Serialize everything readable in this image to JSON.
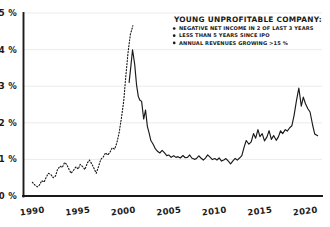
{
  "chart_data": {
    "type": "line",
    "title": "",
    "xlabel": "",
    "ylabel": "",
    "xlim": [
      1989.0,
      2021.8
    ],
    "ylim": [
      0,
      5
    ],
    "grid": true,
    "y_ticks": [
      0,
      1,
      2,
      3,
      4,
      5
    ],
    "y_tick_labels": [
      "0 %",
      "1 %",
      "2 %",
      "3 %",
      "4 %",
      "5 %"
    ],
    "x_ticks": [
      1990,
      1995,
      2000,
      2005,
      2010,
      2015,
      2020
    ],
    "x_tick_labels": [
      "1990",
      "1995",
      "2000",
      "2005",
      "2010",
      "2015",
      "2020"
    ],
    "legend_position": "top-right",
    "series": [
      {
        "name": "Young unprofitable company share (estimated, dashed)",
        "style": "dashed",
        "color": "#1a1a1a",
        "x": [
          1990.0,
          1990.25,
          1990.5,
          1990.75,
          1991.0,
          1991.25,
          1991.5,
          1991.75,
          1992.0,
          1992.25,
          1992.5,
          1992.75,
          1993.0,
          1993.25,
          1993.5,
          1993.75,
          1994.0,
          1994.25,
          1994.5,
          1994.75,
          1995.0,
          1995.25,
          1995.5,
          1995.75,
          1996.0,
          1996.25,
          1996.5,
          1996.75,
          1997.0,
          1997.25,
          1997.5,
          1997.75,
          1998.0,
          1998.25,
          1998.5,
          1998.75,
          1999.0,
          1999.25,
          1999.5,
          1999.75,
          2000.0,
          2000.25,
          2000.5,
          2000.75,
          2001.0
        ],
        "y": [
          0.38,
          0.3,
          0.25,
          0.3,
          0.42,
          0.38,
          0.52,
          0.62,
          0.58,
          0.5,
          0.55,
          0.72,
          0.82,
          0.78,
          0.92,
          0.86,
          0.72,
          0.62,
          0.7,
          0.8,
          0.74,
          0.86,
          0.8,
          0.72,
          0.9,
          0.98,
          0.88,
          0.75,
          0.62,
          0.8,
          1.0,
          1.06,
          1.18,
          1.12,
          1.2,
          1.32,
          1.28,
          1.45,
          1.72,
          2.1,
          2.6,
          3.25,
          3.9,
          4.4,
          4.65
        ]
      },
      {
        "name": "Young unprofitable company share (solid)",
        "style": "solid",
        "color": "#1a1a1a",
        "x": [
          2000.6,
          2000.8,
          2001.0,
          2001.2,
          2001.4,
          2001.6,
          2001.8,
          2002.0,
          2002.2,
          2002.4,
          2002.6,
          2002.8,
          2003.0,
          2003.25,
          2003.5,
          2003.75,
          2004.0,
          2004.25,
          2004.5,
          2004.75,
          2005.0,
          2005.25,
          2005.5,
          2005.75,
          2006.0,
          2006.25,
          2006.5,
          2006.75,
          2007.0,
          2007.25,
          2007.5,
          2007.75,
          2008.0,
          2008.25,
          2008.5,
          2008.75,
          2009.0,
          2009.25,
          2009.5,
          2009.75,
          2010.0,
          2010.25,
          2010.5,
          2010.75,
          2011.0,
          2011.25,
          2011.5,
          2011.75,
          2012.0,
          2012.25,
          2012.5,
          2012.75,
          2013.0,
          2013.25,
          2013.5,
          2013.75,
          2014.0,
          2014.25,
          2014.5,
          2014.75,
          2015.0,
          2015.25,
          2015.5,
          2015.75,
          2016.0,
          2016.25,
          2016.5,
          2016.75,
          2017.0,
          2017.25,
          2017.5,
          2017.75,
          2018.0,
          2018.25,
          2018.5,
          2018.75,
          2019.0,
          2019.25,
          2019.5,
          2019.75,
          2020.0,
          2020.25,
          2020.5,
          2020.75,
          2021.0,
          2021.3
        ],
        "y": [
          3.1,
          3.55,
          4.0,
          3.6,
          3.05,
          2.72,
          2.62,
          2.58,
          2.1,
          2.35,
          1.9,
          1.7,
          1.52,
          1.42,
          1.3,
          1.22,
          1.18,
          1.25,
          1.18,
          1.1,
          1.12,
          1.06,
          1.1,
          1.05,
          1.08,
          1.04,
          1.1,
          1.05,
          1.06,
          1.12,
          1.04,
          1.0,
          1.02,
          1.1,
          1.04,
          0.98,
          1.04,
          1.12,
          1.06,
          1.0,
          1.02,
          0.98,
          1.04,
          0.96,
          0.98,
          1.02,
          0.95,
          0.88,
          0.96,
          1.02,
          0.98,
          1.04,
          1.1,
          1.35,
          1.52,
          1.42,
          1.48,
          1.7,
          1.58,
          1.82,
          1.62,
          1.7,
          1.5,
          1.62,
          1.78,
          1.55,
          1.65,
          1.52,
          1.62,
          1.78,
          1.7,
          1.82,
          1.78,
          1.86,
          1.92,
          2.2,
          2.6,
          2.95,
          2.45,
          2.7,
          2.52,
          2.38,
          2.3,
          1.95,
          1.7,
          1.65
        ]
      }
    ],
    "legend": {
      "title": "YOUNG UNPROFITABLE COMPANY:",
      "items": [
        "NEGATIVE NET INCOME IN 2 OF LAST 3 YEARS",
        "LESS THAN 5 YEARS SINCE IPO",
        "ANNUAL REVENUES GROWING >15 %"
      ]
    }
  }
}
